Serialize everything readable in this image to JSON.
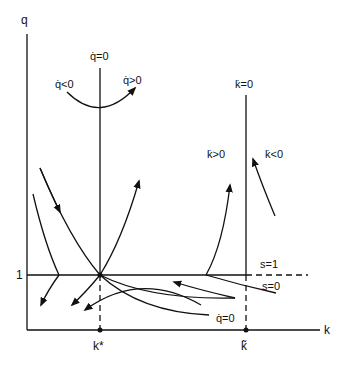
{
  "axes": {
    "y_label": "q",
    "x_label": "k",
    "y_tick_label": "1",
    "x_tick_kstar": "k*",
    "x_tick_ktilde": "k̃"
  },
  "loci": {
    "qdot_zero_top": "q̇=0",
    "qdot_zero_bottom": "q̇=0",
    "kdot_zero": "k̇=0"
  },
  "regions": {
    "qdot_neg": "q̇<0",
    "qdot_pos": "q̇>0",
    "kdot_pos": "k̇>0",
    "kdot_neg": "k̇<0"
  },
  "regimes": {
    "s_one": "s=1",
    "s_zero": "s=0"
  },
  "colors": {
    "ink": "#111111",
    "background": "#ffffff"
  }
}
